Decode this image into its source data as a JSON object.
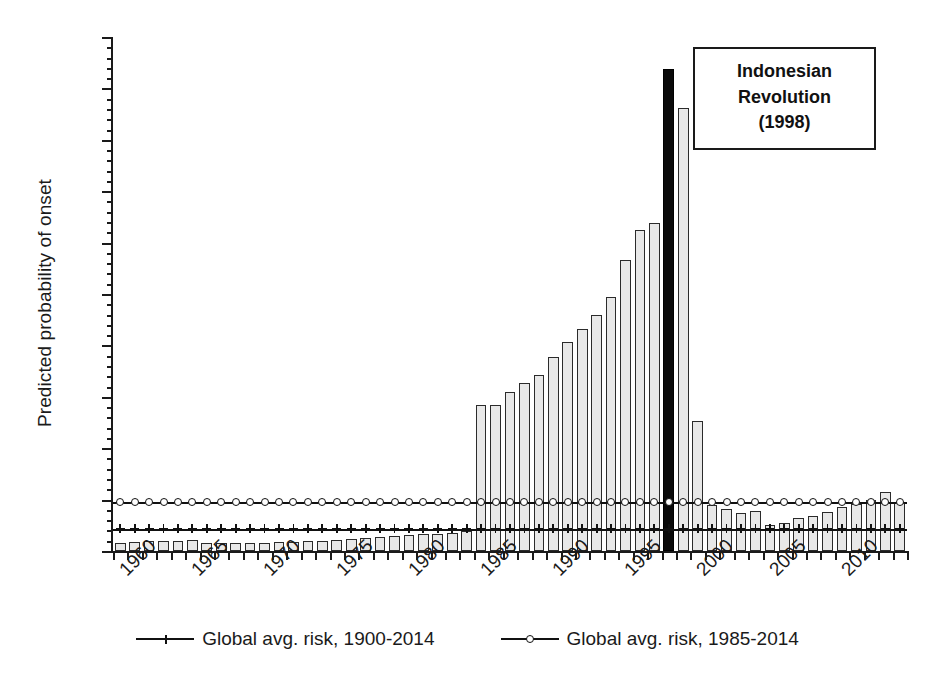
{
  "chart_data": {
    "type": "bar",
    "title": "",
    "xlabel": "",
    "ylabel": "Predicted probability of onset",
    "ylim": [
      0,
      0.1
    ],
    "xlim": [
      1960,
      2014
    ],
    "grid": false,
    "legend_position": "bottom-center",
    "y_tick_labels": [
      "0.10",
      "0.09",
      "0.08",
      "0.07",
      "0.06",
      "0.05",
      "0.04",
      "0.03",
      "0.02",
      "0.01",
      "0.00"
    ],
    "y_tick_values": [
      0.1,
      0.09,
      0.08,
      0.07,
      0.06,
      0.05,
      0.04,
      0.03,
      0.02,
      0.01,
      0.0
    ],
    "y_minor_tick_step": 0.002,
    "x_tick_labels": [
      "1960",
      "1965",
      "1970",
      "1975",
      "1980",
      "1985",
      "1990",
      "1995",
      "2000",
      "2005",
      "2010"
    ],
    "x_tick_values": [
      1960,
      1965,
      1970,
      1975,
      1980,
      1985,
      1990,
      1995,
      2000,
      2005,
      2010
    ],
    "categories": [
      1960,
      1961,
      1962,
      1963,
      1964,
      1965,
      1966,
      1967,
      1968,
      1969,
      1970,
      1971,
      1972,
      1973,
      1974,
      1975,
      1976,
      1977,
      1978,
      1979,
      1980,
      1981,
      1982,
      1983,
      1984,
      1985,
      1986,
      1987,
      1988,
      1989,
      1990,
      1991,
      1992,
      1993,
      1994,
      1995,
      1996,
      1997,
      1998,
      1999,
      2000,
      2001,
      2002,
      2003,
      2004,
      2005,
      2006,
      2007,
      2008,
      2009,
      2010,
      2011,
      2012,
      2013,
      2014
    ],
    "series": [
      {
        "name": "Predicted probability of onset (Indonesia)",
        "type": "bar",
        "fill": "#e8e8e8",
        "edge": "#2b2b2b",
        "highlight_year": 1998,
        "highlight_fill": "#0a0a0a",
        "values": [
          0.0016,
          0.0018,
          0.0019,
          0.0019,
          0.002,
          0.0021,
          0.0016,
          0.0015,
          0.0015,
          0.0016,
          0.0016,
          0.0017,
          0.0018,
          0.0019,
          0.002,
          0.0021,
          0.0023,
          0.0025,
          0.0027,
          0.0029,
          0.0031,
          0.0033,
          0.0034,
          0.0036,
          0.0038,
          0.0285,
          0.0284,
          0.0309,
          0.0327,
          0.0343,
          0.0377,
          0.0407,
          0.0432,
          0.046,
          0.0495,
          0.0566,
          0.0624,
          0.0638,
          0.0938,
          0.0862,
          0.0253,
          0.009,
          0.0082,
          0.0074,
          0.0078,
          0.005,
          0.0055,
          0.0064,
          0.0069,
          0.0076,
          0.0086,
          0.0091,
          0.01,
          0.0115,
          0.0095
        ]
      },
      {
        "name": "Global avg. risk, 1900-2014",
        "type": "line",
        "marker": "plus",
        "value": 0.0043
      },
      {
        "name": "Global avg. risk, 1985-2014",
        "type": "line",
        "marker": "circle",
        "value": 0.0096
      }
    ],
    "annotations": [
      {
        "id": "indonesian-revolution",
        "lines": [
          "Indonesian",
          "Revolution",
          "(1998)"
        ],
        "year": 1998,
        "boxed": true
      }
    ]
  },
  "axes": {
    "y_title": "Predicted probability of onset"
  },
  "legend": {
    "items": [
      {
        "label": "Global avg. risk, 1900-2014",
        "marker": "plus"
      },
      {
        "label": "Global avg. risk, 1985-2014",
        "marker": "circle"
      }
    ]
  },
  "annotation": {
    "line1": "Indonesian",
    "line2": "Revolution",
    "line3": "(1998)"
  },
  "colors": {
    "bar_fill": "#e8e8e8",
    "bar_edge": "#2b2b2b",
    "highlight": "#0a0a0a",
    "axis": "#1a1a1a",
    "background": "#ffffff"
  }
}
